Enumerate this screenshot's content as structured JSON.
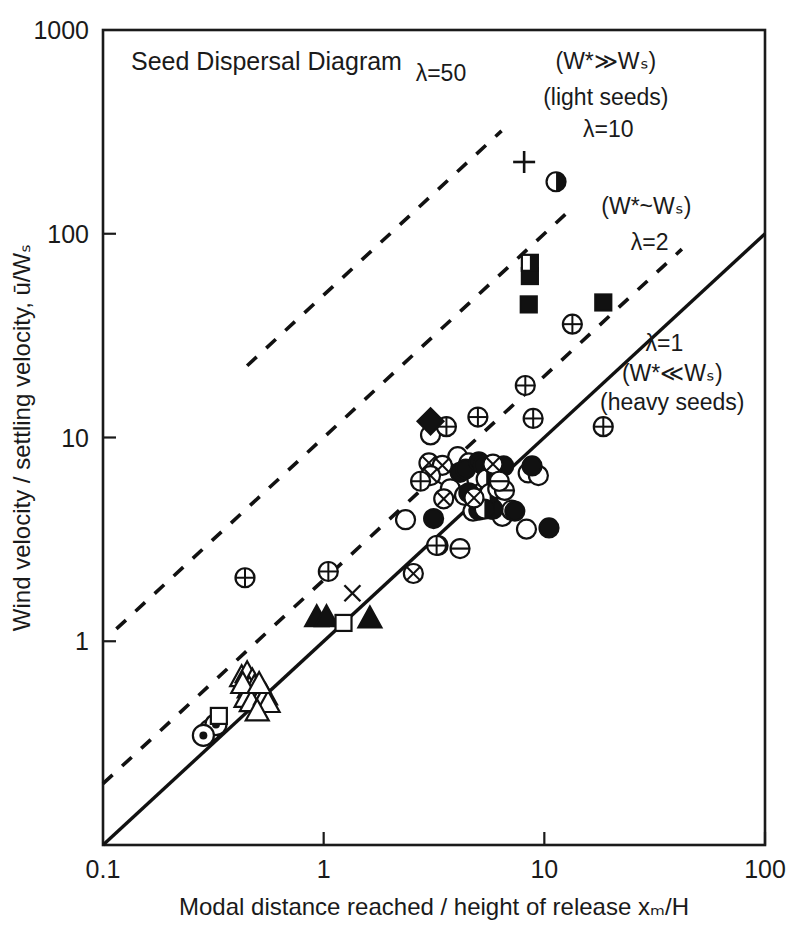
{
  "chart_data": {
    "type": "scatter",
    "title": "Seed Dispersal Diagram",
    "xlabel": "Modal distance reached / height of release xₘ/H",
    "ylabel": "Wind velocity / settling velocity, ū/Wₛ",
    "xscale": "log",
    "yscale": "log",
    "xlim": [
      0.1,
      100
    ],
    "ylim": [
      0.1,
      1000
    ],
    "grid": false,
    "legend": "none",
    "xticks": [
      "0.1",
      "1",
      "10",
      "100"
    ],
    "xtick_values": [
      0.1,
      1,
      10,
      100
    ],
    "yticks": [
      "1000",
      "100",
      "10",
      "1"
    ],
    "ytick_values": [
      1000,
      100,
      10,
      1
    ],
    "annotations": [
      {
        "id": "lambda-50",
        "text": "λ=50",
        "x": 3.4,
        "y": 560
      },
      {
        "id": "w-much-greater",
        "text": "(W*≫Wₛ)",
        "x": 19.0,
        "y": 640
      },
      {
        "id": "light-seeds",
        "text": "(light seeds)",
        "x": 19.0,
        "y": 430
      },
      {
        "id": "lambda-10",
        "text": "λ=10",
        "x": 19.5,
        "y": 300
      },
      {
        "id": "w-approx",
        "text": "(W*~Wₛ)",
        "x": 29.0,
        "y": 125
      },
      {
        "id": "lambda-2",
        "text": "λ=2",
        "x": 30.0,
        "y": 83
      },
      {
        "id": "lambda-1",
        "text": "λ=1",
        "x": 35.0,
        "y": 26.5
      },
      {
        "id": "w-much-less",
        "text": "(W*≪Wₛ)",
        "x": 38.0,
        "y": 19.0
      },
      {
        "id": "heavy-seeds",
        "text": "(heavy seeds)",
        "x": 38.0,
        "y": 13.6
      }
    ],
    "lines": [
      {
        "id": "lambda-1-line",
        "label": "λ=1",
        "style": "solid",
        "x": [
          0.1,
          100
        ],
        "y": [
          0.1,
          100
        ]
      },
      {
        "id": "lambda-2-line",
        "label": "λ=2",
        "style": "dashed",
        "x": [
          0.1,
          42
        ],
        "y": [
          0.2,
          84
        ]
      },
      {
        "id": "lambda-10-line",
        "label": "λ=10",
        "style": "dashed",
        "x": [
          0.115,
          13.0
        ],
        "y": [
          1.15,
          130
        ]
      },
      {
        "id": "lambda-50-line",
        "label": "λ=50",
        "style": "dashed",
        "x": [
          0.45,
          6.4
        ],
        "y": [
          22.5,
          320
        ]
      }
    ],
    "series": [
      {
        "name": "open-circle",
        "marker": "open-circle",
        "points": [
          [
            2.35,
            3.95
          ],
          [
            3.05,
            10.3
          ],
          [
            3.55,
            6.55
          ],
          [
            3.75,
            5.6
          ],
          [
            4.05,
            8.05
          ],
          [
            4.35,
            5.2
          ],
          [
            4.55,
            7.5
          ],
          [
            4.75,
            4.35
          ],
          [
            4.95,
            6.2
          ],
          [
            5.2,
            5.35
          ],
          [
            5.55,
            6.6
          ],
          [
            5.75,
            4.45
          ],
          [
            6.1,
            6.05
          ],
          [
            6.45,
            4.1
          ],
          [
            7.1,
            4.4
          ],
          [
            8.3,
            3.55
          ],
          [
            8.45,
            6.7
          ],
          [
            9.4,
            6.5
          ],
          [
            3.3,
            2.95
          ],
          [
            5.95,
            7.1
          ]
        ]
      },
      {
        "name": "filled-circle",
        "marker": "filled-circle",
        "points": [
          [
            3.15,
            4.0
          ],
          [
            4.15,
            6.75
          ],
          [
            4.4,
            7.0
          ],
          [
            4.55,
            5.35
          ],
          [
            5.05,
            7.6
          ],
          [
            5.3,
            7.3
          ],
          [
            5.55,
            5.25
          ],
          [
            5.85,
            4.45
          ],
          [
            6.15,
            7.15
          ],
          [
            6.55,
            7.25
          ],
          [
            7.35,
            4.35
          ],
          [
            8.8,
            7.25
          ],
          [
            10.5,
            3.6
          ],
          [
            5.05,
            4.4
          ]
        ]
      },
      {
        "name": "half-filled-circle",
        "marker": "half-circle",
        "points": [
          [
            5.45,
            6.25
          ],
          [
            5.65,
            5.3
          ],
          [
            6.15,
            5.6
          ],
          [
            5.35,
            4.45
          ],
          [
            11.3,
            180
          ]
        ]
      },
      {
        "name": "crossed-circle",
        "marker": "crossed-circle",
        "points": [
          [
            3.0,
            7.5
          ],
          [
            3.45,
            7.3
          ],
          [
            3.05,
            6.5
          ],
          [
            5.85,
            7.4
          ],
          [
            2.55,
            2.15
          ],
          [
            3.5,
            5.0
          ],
          [
            4.8,
            5.05
          ]
        ]
      },
      {
        "name": "plus-circle",
        "marker": "plus-circle",
        "points": [
          [
            0.44,
            2.05
          ],
          [
            1.05,
            2.2
          ],
          [
            3.25,
            2.95
          ],
          [
            3.6,
            11.3
          ],
          [
            5.0,
            12.6
          ],
          [
            8.9,
            12.4
          ],
          [
            13.4,
            36.0
          ],
          [
            18.5,
            11.3
          ],
          [
            2.75,
            6.1
          ],
          [
            8.2,
            18.0
          ]
        ]
      },
      {
        "name": "minus-circle",
        "marker": "minus-circle",
        "points": [
          [
            4.15,
            2.85
          ],
          [
            6.6,
            5.5
          ],
          [
            6.25,
            6.1
          ]
        ]
      },
      {
        "name": "circled-dot",
        "marker": "circled-dot",
        "points": [
          [
            0.305,
            0.365
          ],
          [
            0.325,
            0.39
          ],
          [
            0.285,
            0.345
          ]
        ]
      },
      {
        "name": "open-triangle",
        "marker": "open-triangle",
        "points": [
          [
            0.425,
            0.67
          ],
          [
            0.45,
            0.7
          ],
          [
            0.475,
            0.645
          ],
          [
            0.46,
            0.59
          ],
          [
            0.485,
            0.6
          ],
          [
            0.5,
            0.555
          ],
          [
            0.52,
            0.535
          ],
          [
            0.445,
            0.53
          ],
          [
            0.47,
            0.505
          ],
          [
            0.545,
            0.545
          ],
          [
            0.56,
            0.5
          ],
          [
            0.5,
            0.455
          ],
          [
            0.43,
            0.62
          ],
          [
            0.51,
            0.62
          ]
        ]
      },
      {
        "name": "filled-triangle",
        "marker": "filled-triangle",
        "points": [
          [
            0.93,
            1.32
          ],
          [
            1.03,
            1.32
          ],
          [
            1.62,
            1.3
          ]
        ]
      },
      {
        "name": "open-square",
        "marker": "open-square",
        "points": [
          [
            0.335,
            0.43
          ],
          [
            1.23,
            1.23
          ]
        ]
      },
      {
        "name": "filled-square",
        "marker": "filled-square",
        "points": [
          [
            8.6,
            62.0
          ],
          [
            8.5,
            45.0
          ],
          [
            18.5,
            46.0
          ]
        ]
      },
      {
        "name": "half-filled-square",
        "marker": "half-square",
        "points": [
          [
            8.6,
            72.0
          ]
        ]
      },
      {
        "name": "filled-diamond",
        "marker": "filled-diamond",
        "points": [
          [
            3.05,
            12.0
          ]
        ]
      },
      {
        "name": "plus-sign",
        "marker": "plus",
        "points": [
          [
            8.1,
            225.0
          ]
        ]
      },
      {
        "name": "cross-sign",
        "marker": "cross",
        "points": [
          [
            1.35,
            1.72
          ]
        ]
      }
    ]
  },
  "colors": {
    "ink": "#1a1a1a",
    "background": "#ffffff"
  }
}
